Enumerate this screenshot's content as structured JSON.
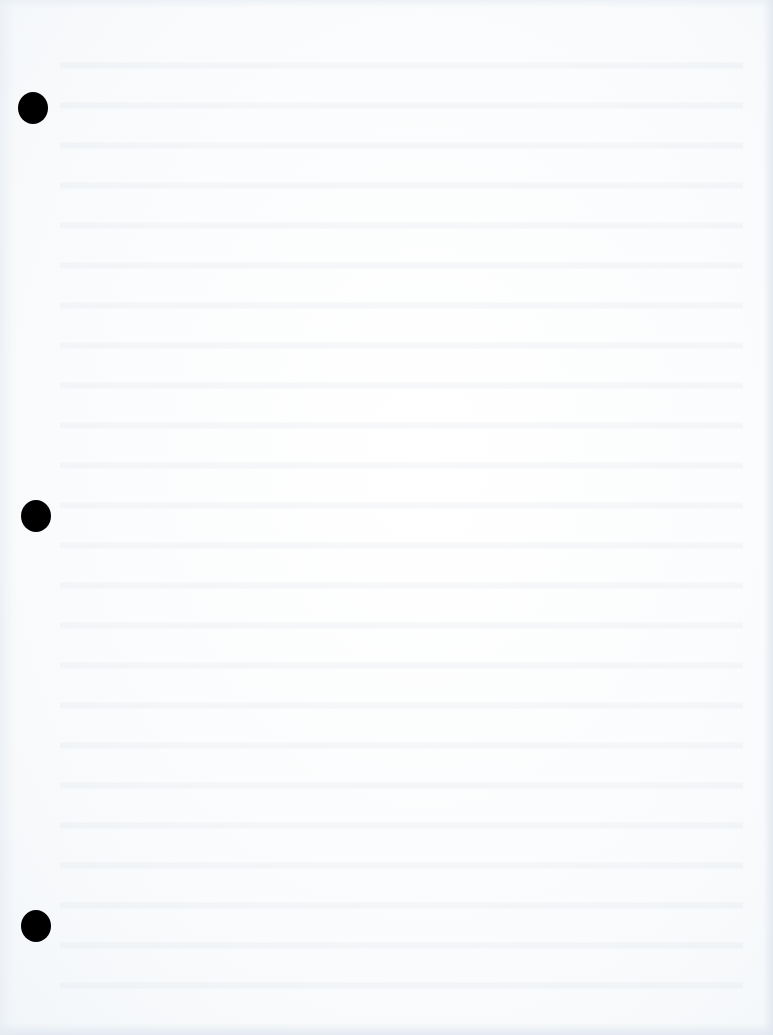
{
  "document": {
    "type": "scanned blank sheet",
    "description": "Blank three-hole-punched paper page",
    "text_content": "",
    "paper_color": "#fbfcfd",
    "edge_tint": "#e1e8f0"
  },
  "punch_holes": [
    {
      "position": "top",
      "x": 18,
      "y": 92,
      "color": "#000000"
    },
    {
      "position": "middle",
      "x": 21,
      "y": 500,
      "color": "#000000"
    },
    {
      "position": "bottom",
      "x": 21,
      "y": 910,
      "color": "#000000"
    }
  ]
}
